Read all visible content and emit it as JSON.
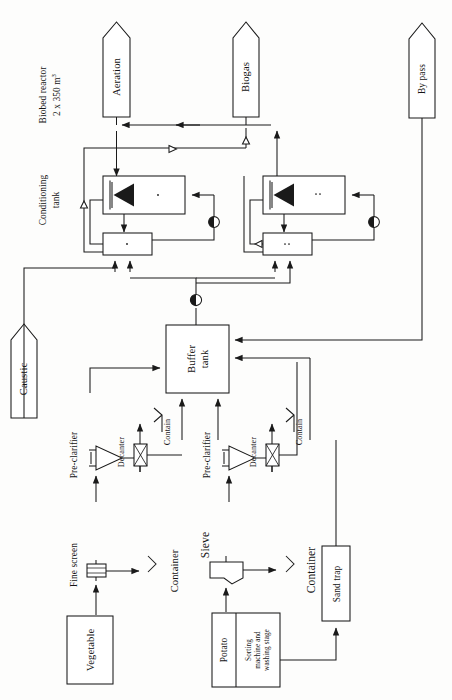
{
  "diagram": {
    "orientation": "rotated-90-ccw",
    "stroke_color": "#1a1a1a",
    "fill_color": "#ffffff",
    "page_size": {
      "width": 452,
      "height": 700
    }
  },
  "outputs": [
    {
      "id": "aeration",
      "label": "Aeration",
      "shape": "pentagon-arrow"
    },
    {
      "id": "biogas",
      "label": "Biogas",
      "shape": "pentagon-arrow"
    },
    {
      "id": "by-pass",
      "label": "By pass",
      "shape": "pentagon-arrow"
    }
  ],
  "inputs": [
    {
      "id": "caustic",
      "label": "Caustic",
      "shape": "pentagon-arrow"
    }
  ],
  "section_labels": [
    {
      "id": "biobed-reactor",
      "line1": "Biobed reactor",
      "line2_prefix": "2 x 350 m",
      "line2_sup": "3"
    },
    {
      "id": "conditioning-tank",
      "line1": "Conditioning",
      "line2": "tank"
    }
  ],
  "units": [
    {
      "id": "buffer-tank",
      "line1": "Buffer",
      "line2": "tank"
    },
    {
      "id": "sand-trap",
      "label": "Sand trap"
    },
    {
      "id": "vegetable",
      "label": "Vegetable"
    },
    {
      "id": "potato",
      "label": "Potato"
    },
    {
      "id": "sorting-washing",
      "line1": "Sorting",
      "line2": "machine and",
      "line3": "washing stage"
    }
  ],
  "equipment": [
    {
      "id": "pre-clarifier-1",
      "label": "Pre-clarifier"
    },
    {
      "id": "pre-clarifier-2",
      "label": "Pre-clarifier"
    },
    {
      "id": "decanter-1",
      "label": "Decanter"
    },
    {
      "id": "decanter-2",
      "label": "Decanter"
    },
    {
      "id": "fine-screen",
      "label": "Fine screen"
    },
    {
      "id": "sieve",
      "label": "Sieve"
    }
  ],
  "containers": [
    {
      "id": "container-decanter-1",
      "label": "Contain"
    },
    {
      "id": "container-decanter-2",
      "label": "Contain"
    },
    {
      "id": "container-fine-screen",
      "label": "Container"
    },
    {
      "id": "container-sieve",
      "label": "Container"
    }
  ],
  "symbols": {
    "pump": "pump-icon",
    "flow_marker": "open-triangle-flow-icon",
    "mixer": "mixer-impeller-icon",
    "arrowhead": "solid-arrowhead-icon"
  }
}
